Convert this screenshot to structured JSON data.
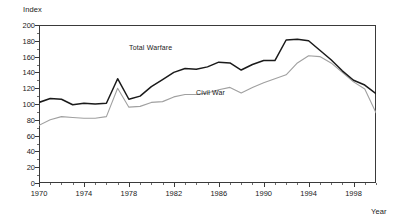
{
  "axes": {
    "y_title": "Index",
    "x_title": "Year",
    "y_ticks": [
      "0",
      "20",
      "40",
      "60",
      "80",
      "100",
      "120",
      "140",
      "160",
      "180",
      "200"
    ],
    "x_ticks": [
      "1970",
      "1974",
      "1978",
      "1982",
      "1986",
      "1990",
      "1994",
      "1998"
    ]
  },
  "series_labels": {
    "total_warfare": "Total Warfare",
    "civil_war": "Civil War"
  },
  "colors": {
    "total_warfare": "#1a1a1a",
    "civil_war": "#a0a0a0",
    "axis": "#3a3a3a",
    "background": "#ffffff"
  },
  "chart_data": {
    "type": "line",
    "title": "",
    "subtitle": "",
    "xlabel": "Year",
    "ylabel": "Index",
    "xlim": [
      1970,
      2000
    ],
    "ylim": [
      0,
      200
    ],
    "y_tick_step": 20,
    "x_tick_step": 4,
    "x_minor_tick_step": 1,
    "grid": false,
    "legend": "inline-annotation",
    "x": [
      1970,
      1971,
      1972,
      1973,
      1974,
      1975,
      1976,
      1977,
      1978,
      1979,
      1980,
      1981,
      1982,
      1983,
      1984,
      1985,
      1986,
      1987,
      1988,
      1989,
      1990,
      1991,
      1992,
      1993,
      1994,
      1995,
      1996,
      1997,
      1998,
      1999,
      2000
    ],
    "series": [
      {
        "name": "Total Warfare",
        "color": "#1a1a1a",
        "values": [
          102,
          107,
          106,
          99,
          101,
          100,
          101,
          132,
          106,
          110,
          122,
          131,
          140,
          145,
          144,
          147,
          153,
          152,
          143,
          150,
          155,
          155,
          181,
          182,
          180,
          168,
          156,
          142,
          130,
          124,
          113
        ]
      },
      {
        "name": "Civil War",
        "color": "#a0a0a0",
        "values": [
          73,
          80,
          84,
          83,
          82,
          82,
          84,
          120,
          96,
          97,
          102,
          103,
          109,
          112,
          112,
          114,
          118,
          121,
          114,
          121,
          127,
          132,
          137,
          152,
          161,
          160,
          152,
          140,
          128,
          119,
          89
        ]
      }
    ],
    "annotations": [
      {
        "text": "Total Warfare",
        "series": "Total Warfare",
        "x": 1981,
        "y": 170
      },
      {
        "text": "Civil War",
        "series": "Civil War",
        "x": 1987,
        "y": 119
      }
    ]
  }
}
